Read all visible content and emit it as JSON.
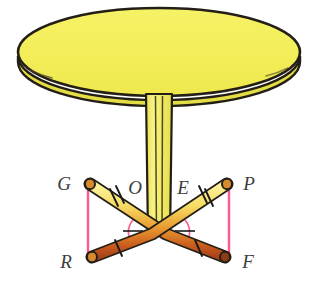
{
  "figure": {
    "name": "pedestal-table-geometry-diagram",
    "background_color": "#ffffff"
  },
  "colors": {
    "tabletop_fill": "#f2ee5a",
    "tabletop_edge_fill": "#e8e34a",
    "outline": "#231f16",
    "column_fill": "#f5f07a",
    "column_shade": "#e3dd55",
    "rod_highlight": "#fdf3a0",
    "rod_mid": "#e8a73a",
    "rod_dark": "#c0521a",
    "construction_line": "#ff5a8a",
    "angle_arc": "#ff5a8a",
    "tick_mark": "#1a1a1a",
    "label_text": "#3d3d3d"
  },
  "labels": [
    {
      "id": "G",
      "text": "G",
      "x": 64,
      "y": 190,
      "anchor": "middle"
    },
    {
      "id": "O",
      "text": "O",
      "x": 135,
      "y": 194,
      "anchor": "middle"
    },
    {
      "id": "E",
      "text": "E",
      "x": 183,
      "y": 194,
      "anchor": "middle"
    },
    {
      "id": "P",
      "text": "P",
      "x": 249,
      "y": 190,
      "anchor": "middle"
    },
    {
      "id": "R",
      "text": "R",
      "x": 66,
      "y": 268,
      "anchor": "middle"
    },
    {
      "id": "F",
      "text": "F",
      "x": 248,
      "y": 268,
      "anchor": "middle"
    }
  ],
  "geometry": {
    "points": {
      "G": {
        "x": 88,
        "y": 182
      },
      "P": {
        "x": 229,
        "y": 182
      },
      "R": {
        "x": 88,
        "y": 258
      },
      "F": {
        "x": 229,
        "y": 258
      },
      "left_vertex": {
        "x": 152,
        "y": 232
      },
      "right_vertex": {
        "x": 166,
        "y": 232
      }
    },
    "construction_segments": [
      {
        "name": "segment-GR",
        "from": "G",
        "to": "R"
      },
      {
        "name": "segment-PF",
        "from": "P",
        "to": "F"
      }
    ],
    "tick_marks": {
      "segment-G-vertex": 2,
      "segment-P-vertex": 2,
      "segment-R-vertex": 1,
      "segment-F-vertex": 1
    },
    "angle_markers": [
      {
        "name": "angle-at-left-vertex",
        "ticks": 1
      },
      {
        "name": "angle-at-right-vertex",
        "ticks": 1
      }
    ]
  },
  "tabletop": {
    "name": "table-top-ellipse",
    "cx": 159,
    "cy": 52,
    "rx": 141,
    "ry": 44
  },
  "column": {
    "name": "table-pedestal-column",
    "top_y": 96,
    "bottom_y": 236,
    "top_half_width": 13,
    "bottom_half_width": 11
  }
}
